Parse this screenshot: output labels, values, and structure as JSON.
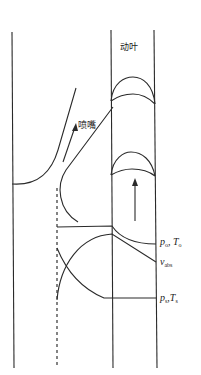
{
  "diagram": {
    "labels": {
      "rotor_blade": "动叶",
      "nozzle": "喷嘴"
    },
    "annotations": [
      {
        "id": "stagnation",
        "main1": "p",
        "sub1": "o",
        "sep": ", ",
        "main2": "T",
        "sub2": "o"
      },
      {
        "id": "velocity",
        "main1": "v",
        "sub1": "abs"
      },
      {
        "id": "static",
        "main1": "p",
        "sub1": "s",
        "sep": ",",
        "main2": "T",
        "sub2": "s"
      }
    ],
    "colors": {
      "line": "#2a2a2a",
      "background": "#ffffff"
    }
  }
}
